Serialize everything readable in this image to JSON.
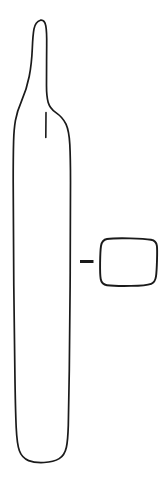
{
  "figure": {
    "kind": "archaeological-artifact-line-drawing",
    "background_color": "#ffffff",
    "ink_color": "#1a1a1a",
    "canvas": {
      "width": 168,
      "height": 483
    },
    "caption": "",
    "scale_label": "",
    "objects": [
      {
        "id": "profile",
        "name": "artifact-profile-outline",
        "description": "Elongated tapering artifact drawn in side profile: narrow rounded tip at top, long slender neck flaring into a shoulder, straight parallel-sided body, flat rounded base.",
        "bounds": {
          "x": 13,
          "y": 19,
          "width": 58,
          "height": 444
        }
      },
      {
        "id": "neck-interior-line",
        "name": "neck-interior-detail-line",
        "description": "Short vertical interior line inside the neck terminating just below the shoulder junction.",
        "bounds": {
          "x": 45,
          "y": 113,
          "width": 2,
          "height": 25
        }
      },
      {
        "id": "cross-section",
        "name": "cross-section-outline",
        "description": "Rounded rectangular cross-section profile shown to the right of the artifact.",
        "bounds": {
          "x": 100,
          "y": 238,
          "width": 57,
          "height": 48
        }
      },
      {
        "id": "section-tick",
        "name": "section-indicator-tick",
        "description": "Short thick horizontal dash linking the artifact body to its cross-section.",
        "bounds": {
          "x": 80,
          "y": 260,
          "width": 14,
          "height": 3
        }
      }
    ]
  }
}
